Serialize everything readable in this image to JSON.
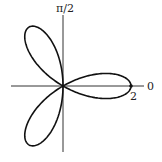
{
  "chart_data": {
    "type": "line",
    "subtype": "polar",
    "equation": "r = 2cos(3θ)",
    "title": "",
    "petals": 3,
    "max_radius": 2,
    "axis_labels": {
      "polar_axis": "0",
      "vertical_axis": "π/2",
      "radius_tick": "2"
    },
    "petal_directions_rad": [
      0,
      2.0944,
      -2.0944
    ],
    "grid": false
  },
  "labels": {
    "zero": "0",
    "half_pi": "π/2",
    "two": "2"
  }
}
